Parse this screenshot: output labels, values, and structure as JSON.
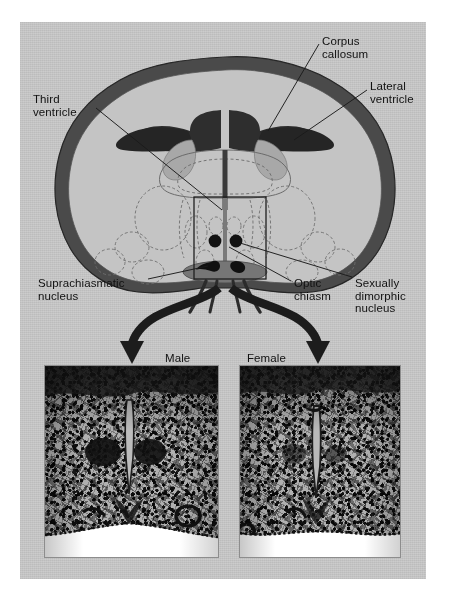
{
  "figure": {
    "kind": "anatomical-diagram",
    "background_color": "#ffffff",
    "plate_color": "#c9c9c9"
  },
  "diagram": {
    "title_visible": false,
    "view": "coronal section of brain (hypothalamic level)",
    "labels": [
      {
        "id": "corpus-callosum",
        "text": "Corpus\ncallosum"
      },
      {
        "id": "lateral-ventricle",
        "text": "Lateral\nventricle"
      },
      {
        "id": "third-ventricle",
        "text": "Third\nventricle"
      },
      {
        "id": "suprachiasmatic-nucleus",
        "text": "Suprachiasmatic\nnucleus"
      },
      {
        "id": "optic-chiasm",
        "text": "Optic\nchiasm"
      },
      {
        "id": "sexually-dimorphic-nucleus",
        "text": "Sexually\ndimorphic\nnucleus"
      }
    ],
    "colors": {
      "cortex_dark": "#3f3f3f",
      "white_matter": "#bdbdbd",
      "gray_matter": "#b0b0b0",
      "ventricle_fill": "#2b2b2b",
      "chiasm_fill": "#7d7d7d",
      "nucleus_fill": "#141414",
      "outline": "#2a2a2a",
      "inset_box": "#1e1e1e"
    }
  },
  "panels": {
    "male": {
      "caption": "Male",
      "arrow": "curved-arrow-left",
      "image_description": "photomicrograph of male hypothalamus showing larger sexually dimorphic nucleus"
    },
    "female": {
      "caption": "Female",
      "arrow": "curved-arrow-right",
      "image_description": "photomicrograph of female hypothalamus showing smaller sexually dimorphic nucleus"
    }
  }
}
